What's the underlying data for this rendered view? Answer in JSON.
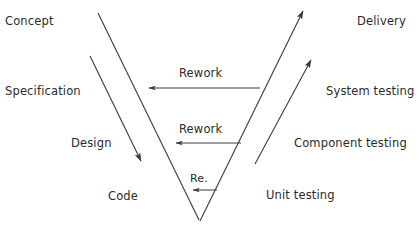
{
  "diagram": {
    "stroke_color": "#3a3a3a",
    "text_color": "#2b2b2b",
    "background_color": "#ffffff",
    "left_branch": {
      "heading": "Development phases",
      "labels": [
        {
          "id": "concept",
          "text": "Concept"
        },
        {
          "id": "specification",
          "text": "Specification"
        },
        {
          "id": "design",
          "text": "Design"
        },
        {
          "id": "code",
          "text": "Code"
        }
      ]
    },
    "right_branch": {
      "heading": "Testing phases",
      "labels": [
        {
          "id": "delivery",
          "text": "Delivery"
        },
        {
          "id": "system-testing",
          "text": "System testing"
        },
        {
          "id": "component-testing",
          "text": "Component testing"
        },
        {
          "id": "unit-testing",
          "text": "Unit testing"
        }
      ]
    },
    "rework_arrows": [
      {
        "id": "rework-1",
        "text": "Rework"
      },
      {
        "id": "rework-2",
        "text": "Rework"
      },
      {
        "id": "rework-3",
        "text": "Re."
      }
    ]
  }
}
